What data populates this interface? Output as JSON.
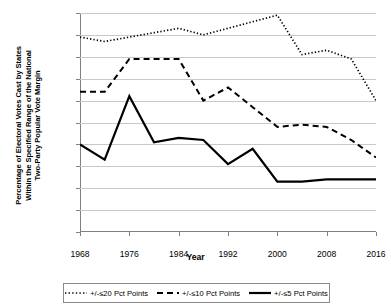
{
  "chart_data": {
    "type": "line",
    "title": "",
    "xlabel": "Year",
    "ylabel": "Percentage of Electoral Votes Cast by States Within the Specified Range of the National Two-Party Popular Vote Margin",
    "ylabel_lines": [
      "Percentage of Electoral Votes Cast by States",
      "Within the Specified Range of the National",
      "Two-Party Popular Vote Margin"
    ],
    "x": [
      1968,
      1972,
      1976,
      1980,
      1984,
      1988,
      1992,
      1996,
      2000,
      2004,
      2008,
      2012,
      2016
    ],
    "xlim": [
      1968,
      2016
    ],
    "ylim": [
      0,
      100
    ],
    "xticks": [
      1968,
      1976,
      1984,
      1992,
      2000,
      2008,
      2016
    ],
    "xtick_labels": [
      "1968",
      "1976",
      "1984",
      "1992",
      "2000",
      "2008",
      "2016"
    ],
    "yticks": [
      0,
      10,
      20,
      30,
      40,
      50,
      60,
      70,
      80,
      90,
      100
    ],
    "ytick_labels": [
      "0%",
      "10%",
      "20%",
      "30%",
      "40%",
      "50%",
      "60%",
      "70%",
      "80%",
      "90%",
      "100%"
    ],
    "grid": true,
    "legend_position": "bottom",
    "series": [
      {
        "name": "+/-≤20 Pct Points",
        "style": "dotted",
        "color": "#000000",
        "values": [
          89,
          87,
          89,
          91,
          93,
          90,
          93,
          96,
          99,
          81,
          83,
          79,
          60
        ]
      },
      {
        "name": "+/-≤10 Pct Points",
        "style": "dashed",
        "color": "#000000",
        "values": [
          64,
          64,
          79,
          79,
          79,
          60,
          66,
          57,
          48,
          49,
          48,
          42,
          34
        ]
      },
      {
        "name": "+/-≤5 Pct Points",
        "style": "solid",
        "color": "#000000",
        "values": [
          40,
          33,
          62,
          41,
          43,
          42,
          31,
          38,
          23,
          23,
          24,
          24,
          24
        ]
      }
    ]
  },
  "legend": {
    "items": [
      {
        "label": "+/-≤20 Pct Points",
        "style": "dotted"
      },
      {
        "label": "+/-≤10 Pct Points",
        "style": "dashed"
      },
      {
        "label": "+/-≤5 Pct Points",
        "style": "solid"
      }
    ]
  },
  "axis": {
    "x_title": "Year"
  }
}
